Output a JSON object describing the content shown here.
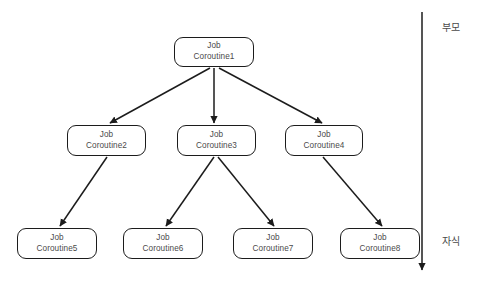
{
  "diagram": {
    "background_color": "#ffffff",
    "node_stroke_color": "#1c1c1c",
    "node_text_color": "#4a4a4a",
    "edge_color": "#1c1c1c",
    "axis": {
      "top_label": "부모",
      "bottom_label": "자식",
      "direction": "downward-arrow"
    },
    "nodes": [
      {
        "id": "c1",
        "line1": "Job",
        "line2": "Coroutine1",
        "x": 174,
        "y": 37,
        "w": 80,
        "h": 30
      },
      {
        "id": "c2",
        "line1": "Job",
        "line2": "Coroutine2",
        "x": 67,
        "y": 125,
        "w": 79,
        "h": 31
      },
      {
        "id": "c3",
        "line1": "Job",
        "line2": "Coroutine3",
        "x": 177,
        "y": 125,
        "w": 79,
        "h": 31
      },
      {
        "id": "c4",
        "line1": "Job",
        "line2": "Coroutine4",
        "x": 285,
        "y": 125,
        "w": 78,
        "h": 31
      },
      {
        "id": "c5",
        "line1": "Job",
        "line2": "Coroutine5",
        "x": 17,
        "y": 228,
        "w": 80,
        "h": 31
      },
      {
        "id": "c6",
        "line1": "Job",
        "line2": "Coroutine6",
        "x": 123,
        "y": 228,
        "w": 80,
        "h": 31
      },
      {
        "id": "c7",
        "line1": "Job",
        "line2": "Coroutine7",
        "x": 233,
        "y": 228,
        "w": 80,
        "h": 31
      },
      {
        "id": "c8",
        "line1": "Job",
        "line2": "Coroutine8",
        "x": 340,
        "y": 228,
        "w": 80,
        "h": 31
      }
    ],
    "edges": [
      {
        "from": "c1",
        "to": "c2"
      },
      {
        "from": "c1",
        "to": "c3"
      },
      {
        "from": "c1",
        "to": "c4"
      },
      {
        "from": "c2",
        "to": "c5"
      },
      {
        "from": "c3",
        "to": "c6"
      },
      {
        "from": "c3",
        "to": "c7"
      },
      {
        "from": "c4",
        "to": "c8"
      }
    ]
  }
}
